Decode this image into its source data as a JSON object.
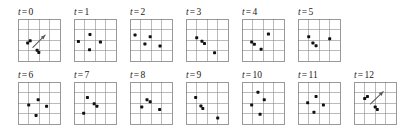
{
  "figure": {
    "title": "",
    "rows": [
      {
        "panel_indices": [
          0,
          1,
          2,
          3,
          4,
          5
        ]
      },
      {
        "panel_indices": [
          6,
          7,
          8,
          9,
          10,
          11,
          12
        ]
      }
    ]
  },
  "chart_data": {
    "type": "scatter",
    "title": "",
    "xlabel": "",
    "ylabel": "",
    "xlim": [
      0,
      4
    ],
    "ylim": [
      0,
      4
    ],
    "grid": true,
    "legend": null,
    "grid_divisions": 4,
    "marker": "square-dot",
    "marker_color": "#111111",
    "gridline_color": "#8c8c8c",
    "arrow_color": "#5a5a5a",
    "panel_label_prefix": "t",
    "panel_label_operator": "=",
    "panels": [
      {
        "label_var": "t",
        "label_op": "=",
        "label_value": "0",
        "points": [
          {
            "x": 0.92,
            "y": 1.72
          },
          {
            "x": 1.16,
            "y": 1.92
          },
          {
            "x": 1.82,
            "y": 1.02
          },
          {
            "x": 1.98,
            "y": 0.82
          }
        ],
        "arrow": {
          "x1": 1.42,
          "y1": 1.3,
          "x2": 2.58,
          "y2": 2.46
        }
      },
      {
        "label_var": "t",
        "label_op": "=",
        "label_value": "1",
        "points": [
          {
            "x": 0.42,
            "y": 1.86
          },
          {
            "x": 1.52,
            "y": 2.52
          },
          {
            "x": 1.48,
            "y": 1.08
          },
          {
            "x": 2.52,
            "y": 1.8
          }
        ],
        "arrow": null
      },
      {
        "label_var": "t",
        "label_op": "=",
        "label_value": "2",
        "points": [
          {
            "x": 0.48,
            "y": 2.48
          },
          {
            "x": 1.92,
            "y": 2.32
          },
          {
            "x": 1.42,
            "y": 1.62
          },
          {
            "x": 2.86,
            "y": 1.42
          }
        ],
        "arrow": null
      },
      {
        "label_var": "t",
        "label_op": "=",
        "label_value": "3",
        "points": [
          {
            "x": 1.02,
            "y": 2.22
          },
          {
            "x": 1.52,
            "y": 1.88
          },
          {
            "x": 1.76,
            "y": 1.66
          },
          {
            "x": 2.72,
            "y": 0.78
          }
        ],
        "arrow": null
      },
      {
        "label_var": "t",
        "label_op": "=",
        "label_value": "4",
        "points": [
          {
            "x": 2.52,
            "y": 2.56
          },
          {
            "x": 0.92,
            "y": 1.82
          },
          {
            "x": 1.18,
            "y": 1.6
          },
          {
            "x": 1.82,
            "y": 1.12
          }
        ],
        "arrow": null
      },
      {
        "label_var": "t",
        "label_op": "=",
        "label_value": "5",
        "points": [
          {
            "x": 1.02,
            "y": 2.32
          },
          {
            "x": 3.02,
            "y": 2.12
          },
          {
            "x": 1.42,
            "y": 1.72
          },
          {
            "x": 1.72,
            "y": 1.46
          }
        ],
        "arrow": null
      },
      {
        "label_var": "t",
        "label_op": "=",
        "label_value": "6",
        "points": [
          {
            "x": 1.92,
            "y": 2.32
          },
          {
            "x": 1.02,
            "y": 1.82
          },
          {
            "x": 2.72,
            "y": 1.68
          },
          {
            "x": 1.72,
            "y": 0.82
          }
        ],
        "arrow": null
      },
      {
        "label_var": "t",
        "label_op": "=",
        "label_value": "7",
        "points": [
          {
            "x": 1.28,
            "y": 2.52
          },
          {
            "x": 1.92,
            "y": 1.92
          },
          {
            "x": 2.18,
            "y": 1.7
          },
          {
            "x": 0.92,
            "y": 1.02
          }
        ],
        "arrow": null
      },
      {
        "label_var": "t",
        "label_op": "=",
        "label_value": "8",
        "points": [
          {
            "x": 1.62,
            "y": 2.32
          },
          {
            "x": 1.92,
            "y": 2.12
          },
          {
            "x": 1.12,
            "y": 1.62
          },
          {
            "x": 2.82,
            "y": 1.38
          }
        ],
        "arrow": null
      },
      {
        "label_var": "t",
        "label_op": "=",
        "label_value": "9",
        "points": [
          {
            "x": 0.92,
            "y": 2.52
          },
          {
            "x": 1.42,
            "y": 1.72
          },
          {
            "x": 1.6,
            "y": 1.48
          },
          {
            "x": 3.02,
            "y": 0.58
          }
        ],
        "arrow": null
      },
      {
        "label_var": "t",
        "label_op": "=",
        "label_value": "10",
        "points": [
          {
            "x": 1.52,
            "y": 3.02
          },
          {
            "x": 2.12,
            "y": 2.32
          },
          {
            "x": 0.92,
            "y": 1.82
          },
          {
            "x": 1.72,
            "y": 0.92
          }
        ],
        "arrow": null
      },
      {
        "label_var": "t",
        "label_op": "=",
        "label_value": "11",
        "points": [
          {
            "x": 1.72,
            "y": 2.62
          },
          {
            "x": 0.92,
            "y": 2.02
          },
          {
            "x": 2.42,
            "y": 1.82
          },
          {
            "x": 1.52,
            "y": 1.12
          }
        ],
        "arrow": null
      },
      {
        "label_var": "t",
        "label_op": "=",
        "label_value": "12",
        "points": [
          {
            "x": 1.02,
            "y": 2.42
          },
          {
            "x": 1.28,
            "y": 2.62
          },
          {
            "x": 2.02,
            "y": 1.62
          },
          {
            "x": 2.22,
            "y": 1.38
          }
        ],
        "arrow": {
          "x1": 1.58,
          "y1": 1.92,
          "x2": 2.78,
          "y2": 3.08
        }
      }
    ]
  }
}
